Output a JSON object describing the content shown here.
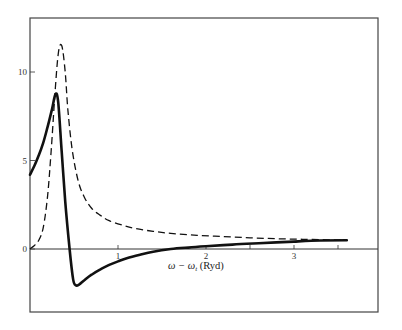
{
  "chart_data": {
    "type": "line",
    "title": "",
    "xlabel": "ω − ω_t (Ryd)",
    "xlabel_main": "ω − ω",
    "xlabel_sub": "t",
    "xlabel_unit": " (Ryd)",
    "ylabel": "",
    "xlim": [
      0,
      4.0
    ],
    "ylim": [
      -3.5,
      13.0
    ],
    "grid": false,
    "legend": null,
    "x_ticks": [
      {
        "value": 1,
        "label": "1"
      },
      {
        "value": 2,
        "label": "2"
      },
      {
        "value": 3,
        "label": "3"
      }
    ],
    "x_minor_ticks": [
      2.5,
      3.5
    ],
    "y_ticks": [
      {
        "value": 0,
        "label": "0"
      },
      {
        "value": 5,
        "label": "5"
      },
      {
        "value": 10,
        "label": "10"
      }
    ],
    "series": [
      {
        "name": "solid",
        "style": "solid",
        "color": "#111111",
        "x": [
          0.0,
          0.05,
          0.1,
          0.15,
          0.2,
          0.25,
          0.29,
          0.32,
          0.36,
          0.4,
          0.45,
          0.49,
          0.52,
          0.56,
          0.62,
          0.7,
          0.8,
          0.9,
          1.0,
          1.1,
          1.25,
          1.4,
          1.6,
          1.8,
          2.0,
          2.3,
          2.6,
          3.0,
          3.3,
          3.6
        ],
        "y": [
          4.2,
          4.7,
          5.3,
          6.0,
          6.9,
          7.9,
          8.75,
          8.3,
          5.5,
          2.7,
          0.0,
          -1.7,
          -2.05,
          -2.0,
          -1.75,
          -1.45,
          -1.15,
          -0.9,
          -0.7,
          -0.52,
          -0.32,
          -0.15,
          0.0,
          0.08,
          0.15,
          0.25,
          0.33,
          0.42,
          0.48,
          0.5
        ]
      },
      {
        "name": "dashed",
        "style": "dashed",
        "color": "#111111",
        "x": [
          0.0,
          0.05,
          0.1,
          0.15,
          0.2,
          0.24,
          0.28,
          0.32,
          0.36,
          0.4,
          0.43,
          0.48,
          0.55,
          0.62,
          0.7,
          0.8,
          0.9,
          1.05,
          1.2,
          1.4,
          1.6,
          1.9,
          2.2,
          2.5,
          2.8,
          3.1,
          3.4,
          3.6
        ],
        "y": [
          0.0,
          0.2,
          0.5,
          1.2,
          3.0,
          5.5,
          8.5,
          11.0,
          11.5,
          10.0,
          7.9,
          5.6,
          3.8,
          2.9,
          2.3,
          1.9,
          1.6,
          1.35,
          1.15,
          1.0,
          0.88,
          0.77,
          0.7,
          0.63,
          0.58,
          0.55,
          0.52,
          0.5
        ]
      }
    ]
  },
  "layout": {
    "frame": {
      "left": 30,
      "top": 18,
      "right": 378,
      "bottom": 312
    },
    "x_origin_px": 30,
    "x_scale_px": 88,
    "y_zero_px": 249,
    "y_scale_px": 17.7
  }
}
